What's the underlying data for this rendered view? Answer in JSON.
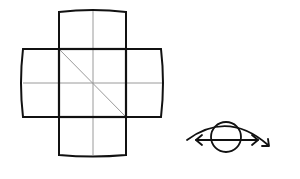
{
  "diagram": {
    "type": "cube-net-cross",
    "colors": {
      "background": "#ffffff",
      "outline": "#111111",
      "guide": "#9a9a9a"
    },
    "faces": [
      {
        "id": "top",
        "x": 59,
        "y": 11,
        "w": 67,
        "h": 38
      },
      {
        "id": "left",
        "x": 23,
        "y": 49,
        "w": 36,
        "h": 68
      },
      {
        "id": "center",
        "x": 59,
        "y": 49,
        "w": 67,
        "h": 68,
        "diagonal": true
      },
      {
        "id": "right",
        "x": 126,
        "y": 49,
        "w": 36,
        "h": 68
      },
      {
        "id": "bottom",
        "x": 59,
        "y": 117,
        "w": 67,
        "h": 38
      }
    ],
    "guides": {
      "vertical_center_x": 93,
      "horizontal_center_y": 83
    },
    "eye_symbol": {
      "icon": "eye-with-rotation-arrow-icon",
      "center_x": 226,
      "center_y": 137,
      "circle_radius": 15
    }
  }
}
